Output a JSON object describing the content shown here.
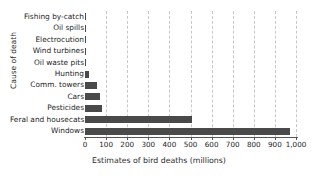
{
  "chart_data": {
    "type": "bar",
    "orientation": "horizontal",
    "title": "",
    "xlabel": "Estimates of bird deaths (millions)",
    "ylabel": "Cause of death",
    "categories": [
      "Fishing by-catch",
      "Oil spills",
      "Electrocution",
      "Wind turbines",
      "Oil waste pits",
      "Hunting",
      "Comm. towers",
      "Cars",
      "Pesticides",
      "Feral and housecats",
      "Windows"
    ],
    "values": [
      2,
      3,
      4,
      5,
      6,
      20,
      58,
      72,
      80,
      505,
      970
    ],
    "xlim": [
      0,
      1000
    ],
    "xticks": [
      0,
      100,
      200,
      300,
      400,
      500,
      600,
      700,
      800,
      900,
      1000
    ],
    "xticklabels": [
      "0",
      "100",
      "200",
      "300",
      "400",
      "500",
      "600",
      "700",
      "800",
      "900",
      "1,000"
    ],
    "grid": "vertical-dashed",
    "legend": "none",
    "bar_color": "#4a4a4a",
    "grid_color": "#c8c8c8",
    "axis_color": "#555555"
  }
}
